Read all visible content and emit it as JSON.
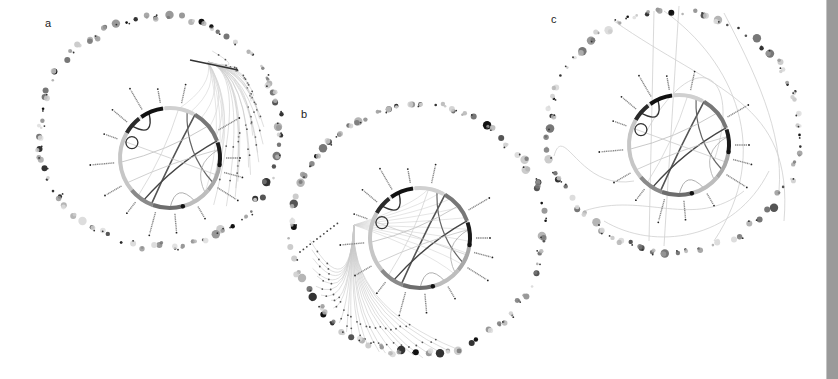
{
  "figure": {
    "background": "#ffffff",
    "side_bar_color": "#9a9a9a"
  },
  "panels": [
    {
      "id": "a",
      "label": "a",
      "label_pos": [
        48,
        27
      ],
      "outer_ring": {
        "cx": 160,
        "cy": 132,
        "rx": 121,
        "ry": 116,
        "node_count": 70
      },
      "inner_circle": {
        "cx": 170,
        "cy": 158,
        "r": 50
      },
      "fan_source": {
        "x": 208,
        "y": 62
      },
      "fan_count": 22,
      "fan_side": "right",
      "sweep_links": 0
    },
    {
      "id": "b",
      "label": "b",
      "label_pos": [
        304,
        118
      ],
      "outer_ring": {
        "cx": 418,
        "cy": 230,
        "rx": 127,
        "ry": 124,
        "node_count": 72
      },
      "inner_circle": {
        "cx": 420,
        "cy": 238,
        "r": 50
      },
      "fan_source": {
        "x": 354,
        "y": 225
      },
      "fan_count": 24,
      "fan_side": "bottom",
      "sweep_links": 0
    },
    {
      "id": "c",
      "label": "c",
      "label_pos": [
        554,
        23
      ],
      "outer_ring": {
        "cx": 674,
        "cy": 131,
        "rx": 126,
        "ry": 120,
        "node_count": 70
      },
      "inner_circle": {
        "cx": 679,
        "cy": 145,
        "r": 50
      },
      "fan_source": null,
      "fan_count": 0,
      "fan_side": "none",
      "sweep_links": 9
    }
  ],
  "inner_circle_segments": [
    {
      "start": -150,
      "end": -128,
      "color": "#2a2a2a",
      "width": 4
    },
    {
      "start": -125,
      "end": -98,
      "color": "#111111",
      "width": 4
    },
    {
      "start": -96,
      "end": -62,
      "color": "#d0d0d0",
      "width": 4
    },
    {
      "start": -60,
      "end": -20,
      "color": "#777777",
      "width": 4
    },
    {
      "start": -18,
      "end": 8,
      "color": "#1a1a1a",
      "width": 4
    },
    {
      "start": 8,
      "end": 40,
      "color": "#a8a8a8",
      "width": 4
    },
    {
      "start": 40,
      "end": 75,
      "color": "#bdbdbd",
      "width": 4
    },
    {
      "start": 75,
      "end": 110,
      "color": "#6d6d6d",
      "width": 4
    },
    {
      "start": 110,
      "end": 140,
      "color": "#8a8a8a",
      "width": 4
    },
    {
      "start": 140,
      "end": 210,
      "color": "#c6c6c6",
      "width": 4
    }
  ],
  "inner_labels_angles": [
    -160,
    -140,
    -120,
    -100,
    -78,
    -30,
    0,
    15,
    32,
    60,
    85,
    105,
    128,
    150,
    175
  ],
  "chords": [
    {
      "from": -60,
      "to": 112,
      "color": "#555555",
      "width": 1.6
    },
    {
      "from": -20,
      "to": 122,
      "color": "#444444",
      "width": 1.4
    },
    {
      "from": -70,
      "to": 30,
      "color": "#666666",
      "width": 1.2
    },
    {
      "from": 175,
      "to": -40,
      "color": "#bbbbbb",
      "width": 0.8
    },
    {
      "from": 150,
      "to": -10,
      "color": "#c4c4c4",
      "width": 0.8
    },
    {
      "from": 200,
      "to": 20,
      "color": "#cccccc",
      "width": 0.8
    },
    {
      "from": 90,
      "to": 60,
      "color": "#999999",
      "width": 0.8
    },
    {
      "from": -10,
      "to": 45,
      "color": "#aaaaaa",
      "width": 0.8
    },
    {
      "from": 130,
      "to": -80,
      "color": "#cfcfcf",
      "width": 0.7
    },
    {
      "from": -140,
      "to": -115,
      "color": "#333333",
      "width": 1.4
    }
  ],
  "node_palette": [
    "#111111",
    "#333333",
    "#555555",
    "#777777",
    "#999999",
    "#b5b5b5",
    "#cccccc",
    "#dddddd"
  ]
}
